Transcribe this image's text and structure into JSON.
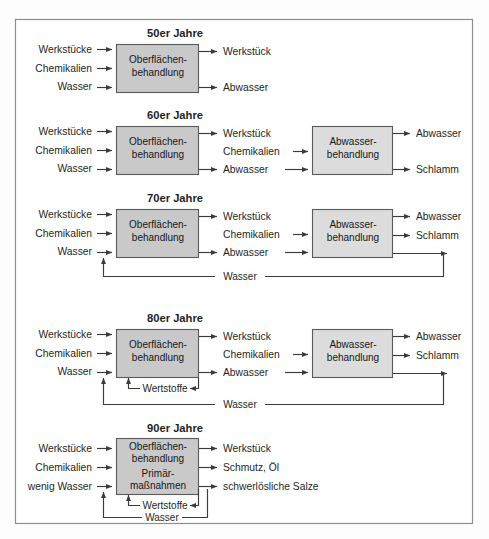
{
  "figure": {
    "kind": "process-flow-diagram",
    "frame_border_color": "#8d8d8d",
    "box_fill_primary": "#c9c9c9",
    "box_fill_secondary": "#dcdcdc",
    "line_color": "#3a3a3a",
    "text_color": "#1f1f1f"
  },
  "sections": [
    {
      "id": "s50",
      "title": "50er Jahre",
      "inputs": [
        "Werkstücke",
        "Chemikalien",
        "Wasser"
      ],
      "process_box": {
        "lines": [
          "Oberflächen-",
          "behandlung"
        ]
      },
      "outputs": [
        "Werkstück",
        "Abwasser"
      ],
      "second_box": null,
      "second_box_outputs": [],
      "middle_feed": null,
      "loops": []
    },
    {
      "id": "s60",
      "title": "60er Jahre",
      "inputs": [
        "Werkstücke",
        "Chemikalien",
        "Wasser"
      ],
      "process_box": {
        "lines": [
          "Oberflächen-",
          "behandlung"
        ]
      },
      "outputs": [
        "Werkstück",
        "Chemikalien",
        "Abwasser"
      ],
      "second_box": {
        "lines": [
          "Abwasser-",
          "behandlung"
        ]
      },
      "second_box_outputs": [
        "Abwasser",
        "Schlamm"
      ],
      "middle_feed": [
        "Chemikalien",
        "Abwasser"
      ],
      "loops": []
    },
    {
      "id": "s70",
      "title": "70er Jahre",
      "inputs": [
        "Werkstücke",
        "Chemikalien",
        "Wasser"
      ],
      "process_box": {
        "lines": [
          "Oberflächen-",
          "behandlung"
        ]
      },
      "outputs": [
        "Werkstück",
        "Chemikalien",
        "Abwasser"
      ],
      "second_box": {
        "lines": [
          "Abwasser-",
          "behandlung"
        ]
      },
      "second_box_outputs": [
        "Abwasser",
        "Schlamm"
      ],
      "middle_feed": [
        "Chemikalien",
        "Abwasser"
      ],
      "loops": [
        "Wasser"
      ]
    },
    {
      "id": "s80",
      "title": "80er Jahre",
      "inputs": [
        "Werkstücke",
        "Chemikalien",
        "Wasser"
      ],
      "process_box": {
        "lines": [
          "Oberflächen-",
          "behandlung"
        ]
      },
      "outputs": [
        "Werkstück",
        "Chemikalien",
        "Abwasser"
      ],
      "second_box": {
        "lines": [
          "Abwasser-",
          "behandlung"
        ]
      },
      "second_box_outputs": [
        "Abwasser",
        "Schlamm"
      ],
      "middle_feed": [
        "Chemikalien",
        "Abwasser"
      ],
      "loops": [
        "Wertstoffe",
        "Wasser"
      ]
    },
    {
      "id": "s90",
      "title": "90er Jahre",
      "inputs": [
        "Werkstücke",
        "Chemikalien",
        "wenig Wasser"
      ],
      "process_box": {
        "lines": [
          "Oberflächen-",
          "behandlung",
          "Primär-",
          "maßnahmen"
        ]
      },
      "outputs": [
        "Werkstück",
        "Schmutz, Öl",
        "schwerlösliche Salze"
      ],
      "second_box": null,
      "second_box_outputs": [],
      "middle_feed": null,
      "loops": [
        "Wertstoffe",
        "Wasser"
      ]
    }
  ]
}
